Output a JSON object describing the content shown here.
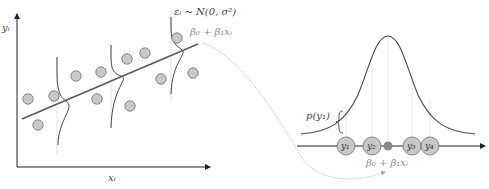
{
  "left_plot": {
    "y_axis_label": "yᵢ",
    "x_axis_label": "xᵢ",
    "error_label": "εᵢ ~ N(0, σ²)",
    "line_label": "β₀ + β₁xᵢ",
    "points": [
      [
        28,
        99
      ],
      [
        38,
        125
      ],
      [
        54,
        96
      ],
      [
        76,
        76
      ],
      [
        101,
        76
      ],
      [
        97,
        99
      ],
      [
        127,
        59
      ],
      [
        130,
        106
      ],
      [
        145,
        53
      ],
      [
        161,
        79
      ],
      [
        177,
        38
      ],
      [
        193,
        73
      ]
    ]
  },
  "right_plot": {
    "density_label": "p(y₁)",
    "mean_label": "β₀ + β₁xᵢ",
    "observations": [
      "y₁",
      "y₂",
      "y₃",
      "y₄"
    ]
  },
  "colors": {
    "point_fill": "#c8c8c8",
    "point_stroke": "#6e6e6e",
    "line": "#5a5a5a",
    "curve": "#444444",
    "mean_dot": "#888888",
    "dotted": "#b8b8b8"
  }
}
